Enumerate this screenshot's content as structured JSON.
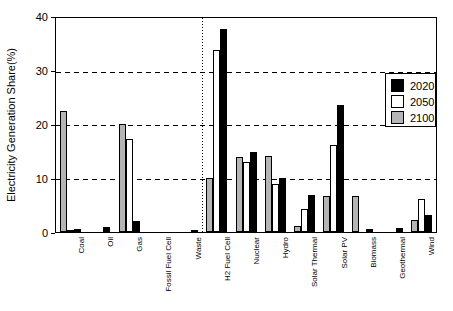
{
  "chart_data": {
    "type": "bar",
    "title": "",
    "xlabel": "",
    "ylabel": "Electricity Generation Share(%)",
    "ylim": [
      0,
      40
    ],
    "yticks": [
      0,
      10,
      20,
      30,
      40
    ],
    "gridlines_at": [
      10,
      20,
      30
    ],
    "grid_style": "dashed-horizontal",
    "separator_after_category_index": 5,
    "legend_position": "upper-right-inside",
    "legend_order": [
      "2020",
      "2050",
      "2100"
    ],
    "bar_order_within_group": [
      "2100",
      "2050",
      "2020"
    ],
    "categories": [
      "Coal",
      "Oil",
      "Gas",
      "Fossil Fuel Cell",
      "Waste",
      "H2 Fuel Cell",
      "Nuclear",
      "Hydro",
      "Solar Thermal",
      "Solar PV",
      "Biomass",
      "Geothermal",
      "Wind"
    ],
    "series": [
      {
        "name": "2020",
        "color": "#000000",
        "values": [
          0.5,
          1.0,
          2.0,
          0,
          0.4,
          38,
          15,
          10,
          7,
          23.7,
          0.5,
          0.8,
          3.1
        ]
      },
      {
        "name": "2050",
        "color": "#ffffff",
        "values": [
          0.3,
          0,
          17.3,
          0,
          0,
          34,
          13,
          9,
          4.3,
          16.2,
          0,
          0,
          6.2
        ]
      },
      {
        "name": "2100",
        "color": "#b5b5b5",
        "values": [
          22.7,
          0,
          20.2,
          0,
          0,
          10,
          14,
          14.2,
          1.2,
          6.8,
          6.8,
          0,
          2.3
        ]
      }
    ],
    "colors": {
      "frame": "#000000",
      "background": "#ffffff",
      "gridline": "#000000"
    }
  }
}
